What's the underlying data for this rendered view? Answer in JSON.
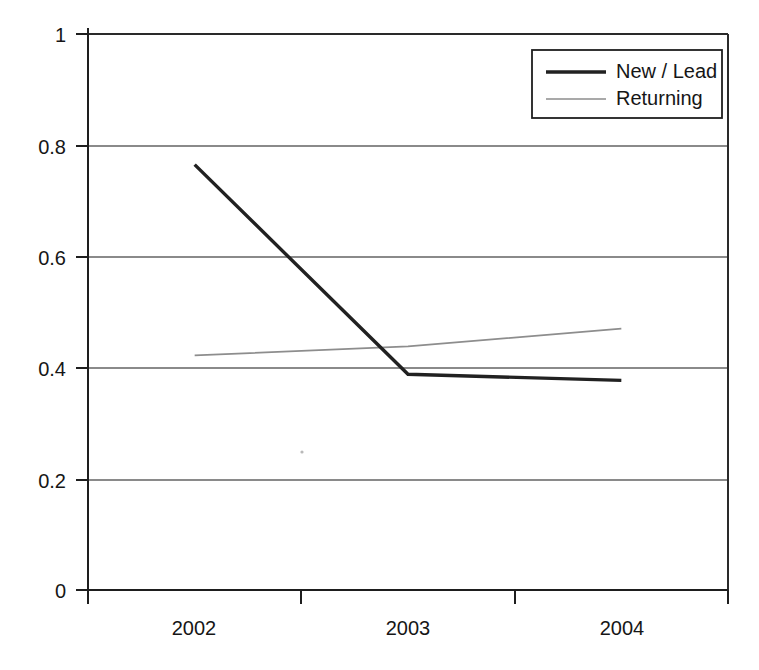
{
  "chart_data": {
    "type": "line",
    "title": "",
    "subtitle": "",
    "xlabel": "",
    "ylabel": "",
    "categories": [
      "2002",
      "2003",
      "2004"
    ],
    "series": [
      {
        "name": "New / Lead",
        "values": [
          0.765,
          0.388,
          0.377
        ],
        "color": "#212121",
        "line_width": "thick"
      },
      {
        "name": "Returning",
        "values": [
          0.422,
          0.438,
          0.47
        ],
        "color": "#8d8d8d",
        "line_width": "thin"
      }
    ],
    "ylim": [
      0,
      1
    ],
    "y_ticks": [
      "0",
      "0.2",
      "0.4",
      "0.6",
      "0.8",
      "1"
    ],
    "y_tick_values": [
      0,
      0.2,
      0.4,
      0.6,
      0.8,
      1
    ],
    "x_ticks": [
      "2002",
      "2003",
      "2004"
    ],
    "grid": "horizontal",
    "legend_position": "top-right",
    "background": "#ffffff"
  },
  "axes": {
    "y": {
      "ticks": [
        {
          "label": "1",
          "value": 1
        },
        {
          "label": "0.8",
          "value": 0.8
        },
        {
          "label": "0.6",
          "value": 0.6
        },
        {
          "label": "0.4",
          "value": 0.4
        },
        {
          "label": "0.2",
          "value": 0.2
        },
        {
          "label": "0",
          "value": 0
        }
      ]
    },
    "x": {
      "ticks": [
        {
          "label": "2002"
        },
        {
          "label": "2003"
        },
        {
          "label": "2004"
        }
      ]
    }
  },
  "legend": {
    "entries": [
      {
        "label": "New / Lead",
        "swatch": "thick-dark-line"
      },
      {
        "label": "Returning",
        "swatch": "thin-gray-line"
      }
    ]
  }
}
